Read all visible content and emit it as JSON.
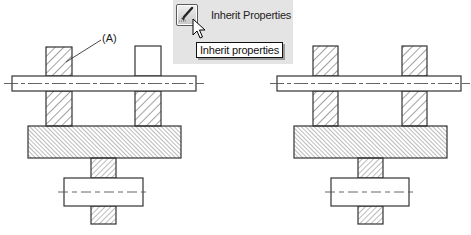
{
  "figure": {
    "callout_label": "(A)",
    "colors": {
      "line": "#333333",
      "hatch": "#444444",
      "centerline": "#555555",
      "panel_bg": "#e4e4e4",
      "tooltip_bg": "#ffffff"
    }
  },
  "toolbar_popup": {
    "button_icon": "paintbrush-icon",
    "button_label": "Inherit Properties",
    "tooltip_text": "Inherit properties",
    "cursor": "arrow-cursor-icon"
  },
  "drawings": [
    {
      "name": "before",
      "left_column": "hatched",
      "right_column_top": "unhatched",
      "right_column_bottom": "hatched"
    },
    {
      "name": "after",
      "left_column": "hatched",
      "right_column_top": "hatched",
      "right_column_bottom": "hatched"
    }
  ]
}
